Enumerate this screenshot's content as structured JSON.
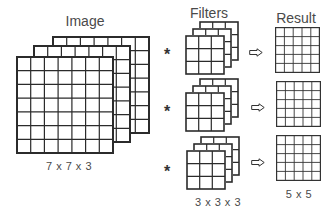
{
  "image": {
    "title": "Image",
    "dimensions": "7 x 7 x 3",
    "rows": 7,
    "cols": 7,
    "channels": 3
  },
  "filters": {
    "title": "Filters",
    "dimensions": "3 x 3 x 3",
    "rows": 3,
    "cols": 3,
    "channels": 3,
    "count": 3,
    "operator_symbol": "*"
  },
  "result": {
    "title": "Result",
    "dimensions": "5 x 5",
    "rows": 5,
    "cols": 5,
    "count": 3,
    "arrow_icon": "outline-right-arrow"
  },
  "colors": {
    "line": "#2b2b2b",
    "text": "#4a4a4a",
    "background": "#ffffff"
  }
}
